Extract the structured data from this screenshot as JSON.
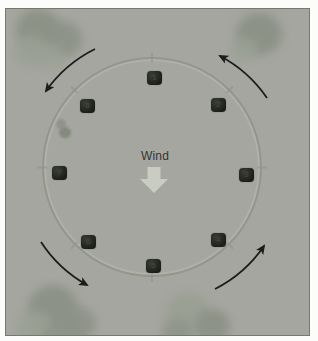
{
  "board": {
    "wind_label": "Wind",
    "wind_arrow_direction": "down",
    "rotation_direction": "counterclockwise",
    "direction_buttons": [
      {
        "label": "1",
        "position": "top"
      },
      {
        "label": "2",
        "position": "upper-right"
      },
      {
        "label": "3",
        "position": "right"
      },
      {
        "label": "4",
        "position": "lower-right"
      },
      {
        "label": "5",
        "position": "bottom"
      },
      {
        "label": "6",
        "position": "lower-left"
      },
      {
        "label": "7",
        "position": "left"
      },
      {
        "label": "8",
        "position": "upper-left"
      }
    ],
    "colors": {
      "panel_bg": "#a5a69f",
      "panel_border": "#75786f",
      "ring": "#90938a",
      "ring_highlight": "#b3b5ab",
      "button_bg": "#1b1d18",
      "button_label": "#454a3f",
      "rot_arrow": "#1c1c1c",
      "wind_text": "#333333",
      "wind_arrow": "#c9ccc1",
      "cloud_dark": "#8d9287",
      "cloud_light": "#9aa094"
    }
  }
}
